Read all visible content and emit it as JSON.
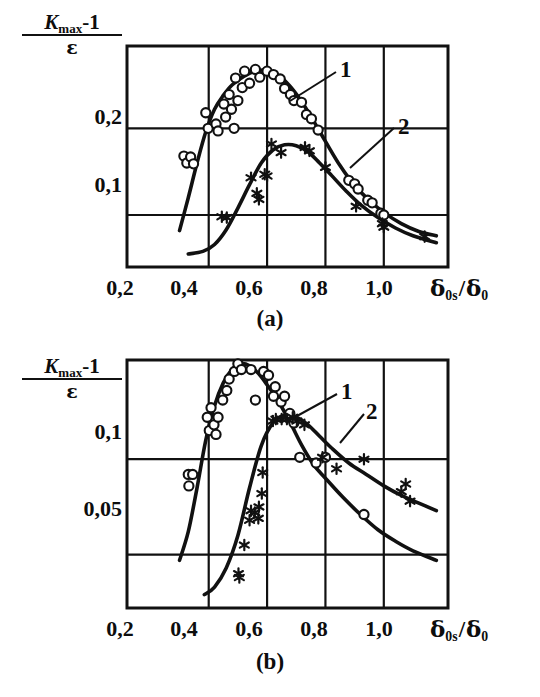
{
  "figure": {
    "background": "#ffffff",
    "ink": "#111111",
    "panels": [
      {
        "id": "a",
        "caption": "(a)",
        "y_axis": {
          "label_numerator_italic": "K",
          "label_numerator_sub": "max",
          "label_numerator_tail": "-1",
          "label_denominator": "ε",
          "ticks": [
            {
              "value": 0.2,
              "label": "0,2"
            },
            {
              "value": 0.1,
              "label": "0,1"
            }
          ]
        },
        "x_axis": {
          "title_symbol": "δ",
          "title_sub_1": "0s",
          "title_slash": "/",
          "title_symbol_2": "δ",
          "title_sub_2": "0",
          "ticks": [
            {
              "value": 0.2,
              "label": "0,2"
            },
            {
              "value": 0.4,
              "label": "0,4"
            },
            {
              "value": 0.6,
              "label": "0,6"
            },
            {
              "value": 0.8,
              "label": "0,8"
            },
            {
              "value": 1.0,
              "label": "1,0"
            }
          ]
        },
        "curve_tags": [
          {
            "text": "1"
          },
          {
            "text": "2"
          }
        ]
      },
      {
        "id": "b",
        "caption": "(b)",
        "y_axis": {
          "label_numerator_italic": "K",
          "label_numerator_sub": "max",
          "label_numerator_tail": "-1",
          "label_denominator": "ε",
          "ticks": [
            {
              "value": 0.1,
              "label": "0,1"
            },
            {
              "value": 0.05,
              "label": "0,05"
            }
          ]
        },
        "x_axis": {
          "title_symbol": "δ",
          "title_sub_1": "0s",
          "title_slash": "/",
          "title_symbol_2": "δ",
          "title_sub_2": "0",
          "ticks": [
            {
              "value": 0.2,
              "label": "0,2"
            },
            {
              "value": 0.4,
              "label": "0,4"
            },
            {
              "value": 0.6,
              "label": "0,6"
            },
            {
              "value": 0.8,
              "label": "0,8"
            },
            {
              "value": 1.0,
              "label": "1,0"
            }
          ]
        },
        "curve_tags": [
          {
            "text": "1"
          },
          {
            "text": "2"
          }
        ]
      }
    ]
  },
  "chart_data": [
    {
      "id": "a",
      "type": "scatter",
      "title": "(a)",
      "xlabel": "δ₀ₛ/δ₀",
      "ylabel": "(K_max − 1)/ε",
      "xlim": [
        0.12,
        1.22
      ],
      "ylim": [
        0.04,
        0.295
      ],
      "grid": true,
      "xticks": [
        0.2,
        0.4,
        0.6,
        0.8,
        1.0
      ],
      "yticks": [
        0.1,
        0.2
      ],
      "legend_position": "inside-annotations",
      "series": [
        {
          "name": "1",
          "marker": "open-circle",
          "points": [
            [
              0.315,
              0.168
            ],
            [
              0.325,
              0.16
            ],
            [
              0.338,
              0.167
            ],
            [
              0.348,
              0.159
            ],
            [
              0.39,
              0.218
            ],
            [
              0.398,
              0.2
            ],
            [
              0.425,
              0.205
            ],
            [
              0.432,
              0.197
            ],
            [
              0.452,
              0.228
            ],
            [
              0.458,
              0.213
            ],
            [
              0.47,
              0.239
            ],
            [
              0.478,
              0.222
            ],
            [
              0.487,
              0.2
            ],
            [
              0.492,
              0.258
            ],
            [
              0.5,
              0.232
            ],
            [
              0.515,
              0.247
            ],
            [
              0.523,
              0.266
            ],
            [
              0.54,
              0.252
            ],
            [
              0.56,
              0.268
            ],
            [
              0.575,
              0.259
            ],
            [
              0.6,
              0.266
            ],
            [
              0.622,
              0.262
            ],
            [
              0.645,
              0.257
            ],
            [
              0.66,
              0.246
            ],
            [
              0.68,
              0.239
            ],
            [
              0.692,
              0.232
            ],
            [
              0.718,
              0.23
            ],
            [
              0.735,
              0.216
            ],
            [
              0.752,
              0.211
            ],
            [
              0.775,
              0.198
            ],
            [
              0.88,
              0.14
            ],
            [
              0.9,
              0.136
            ],
            [
              0.912,
              0.13
            ],
            [
              0.945,
              0.117
            ],
            [
              0.96,
              0.114
            ],
            [
              0.99,
              0.102
            ],
            [
              1.0,
              0.1
            ]
          ],
          "curve": [
            [
              0.3,
              0.082
            ],
            [
              0.33,
              0.12
            ],
            [
              0.36,
              0.16
            ],
            [
              0.39,
              0.196
            ],
            [
              0.42,
              0.222
            ],
            [
              0.45,
              0.238
            ],
            [
              0.48,
              0.25
            ],
            [
              0.52,
              0.26
            ],
            [
              0.56,
              0.266
            ],
            [
              0.6,
              0.267
            ],
            [
              0.64,
              0.261
            ],
            [
              0.68,
              0.248
            ],
            [
              0.72,
              0.23
            ],
            [
              0.76,
              0.208
            ],
            [
              0.8,
              0.185
            ],
            [
              0.85,
              0.157
            ],
            [
              0.9,
              0.134
            ],
            [
              0.95,
              0.117
            ],
            [
              1.0,
              0.103
            ],
            [
              1.06,
              0.09
            ],
            [
              1.12,
              0.081
            ],
            [
              1.18,
              0.076
            ]
          ]
        },
        {
          "name": "2",
          "marker": "asterisk",
          "points": [
            [
              0.445,
              0.098
            ],
            [
              0.462,
              0.097
            ],
            [
              0.545,
              0.143
            ],
            [
              0.565,
              0.125
            ],
            [
              0.572,
              0.118
            ],
            [
              0.592,
              0.147
            ],
            [
              0.6,
              0.145
            ],
            [
              0.615,
              0.182
            ],
            [
              0.648,
              0.172
            ],
            [
              0.73,
              0.178
            ],
            [
              0.745,
              0.174
            ],
            [
              0.8,
              0.155
            ],
            [
              0.905,
              0.11
            ],
            [
              0.995,
              0.09
            ],
            [
              1.0,
              0.086
            ],
            [
              1.14,
              0.075
            ]
          ],
          "curve": [
            [
              0.33,
              0.055
            ],
            [
              0.38,
              0.058
            ],
            [
              0.42,
              0.066
            ],
            [
              0.46,
              0.083
            ],
            [
              0.5,
              0.108
            ],
            [
              0.54,
              0.135
            ],
            [
              0.58,
              0.16
            ],
            [
              0.62,
              0.175
            ],
            [
              0.66,
              0.181
            ],
            [
              0.7,
              0.18
            ],
            [
              0.74,
              0.173
            ],
            [
              0.78,
              0.16
            ],
            [
              0.82,
              0.146
            ],
            [
              0.87,
              0.128
            ],
            [
              0.92,
              0.112
            ],
            [
              0.98,
              0.097
            ],
            [
              1.04,
              0.085
            ],
            [
              1.1,
              0.076
            ],
            [
              1.18,
              0.068
            ]
          ]
        }
      ]
    },
    {
      "id": "b",
      "type": "scatter",
      "title": "(b)",
      "xlabel": "δ₀ₛ/δ₀",
      "ylabel": "(K_max − 1)/ε",
      "xlim": [
        0.12,
        1.22
      ],
      "ylim": [
        0.022,
        0.152
      ],
      "grid": true,
      "xticks": [
        0.2,
        0.4,
        0.6,
        0.8,
        1.0
      ],
      "yticks": [
        0.05,
        0.1
      ],
      "legend_position": "inside-annotations",
      "series": [
        {
          "name": "1",
          "marker": "open-circle",
          "points": [
            [
              0.33,
              0.092
            ],
            [
              0.345,
              0.092
            ],
            [
              0.332,
              0.086
            ],
            [
              0.395,
              0.122
            ],
            [
              0.402,
              0.115
            ],
            [
              0.408,
              0.127
            ],
            [
              0.418,
              0.118
            ],
            [
              0.425,
              0.113
            ],
            [
              0.432,
              0.122
            ],
            [
              0.448,
              0.131
            ],
            [
              0.462,
              0.136
            ],
            [
              0.47,
              0.142
            ],
            [
              0.488,
              0.146
            ],
            [
              0.5,
              0.15
            ],
            [
              0.512,
              0.147
            ],
            [
              0.545,
              0.147
            ],
            [
              0.56,
              0.131
            ],
            [
              0.588,
              0.146
            ],
            [
              0.605,
              0.144
            ],
            [
              0.622,
              0.133
            ],
            [
              0.628,
              0.138
            ],
            [
              0.648,
              0.13
            ],
            [
              0.66,
              0.133
            ],
            [
              0.678,
              0.124
            ],
            [
              0.692,
              0.119
            ],
            [
              0.712,
              0.101
            ],
            [
              0.768,
              0.098
            ],
            [
              0.8,
              0.101
            ],
            [
              0.932,
              0.071
            ]
          ],
          "curve": [
            [
              0.3,
              0.047
            ],
            [
              0.33,
              0.062
            ],
            [
              0.36,
              0.085
            ],
            [
              0.39,
              0.11
            ],
            [
              0.42,
              0.128
            ],
            [
              0.45,
              0.14
            ],
            [
              0.48,
              0.147
            ],
            [
              0.51,
              0.15
            ],
            [
              0.54,
              0.149
            ],
            [
              0.57,
              0.145
            ],
            [
              0.6,
              0.139
            ],
            [
              0.64,
              0.13
            ],
            [
              0.68,
              0.119
            ],
            [
              0.72,
              0.107
            ],
            [
              0.76,
              0.097
            ],
            [
              0.8,
              0.09
            ],
            [
              0.86,
              0.08
            ],
            [
              0.92,
              0.071
            ],
            [
              0.98,
              0.063
            ],
            [
              1.04,
              0.057
            ],
            [
              1.1,
              0.052
            ],
            [
              1.18,
              0.047
            ]
          ]
        },
        {
          "name": "2",
          "marker": "asterisk",
          "points": [
            [
              0.502,
              0.04
            ],
            [
              0.505,
              0.038
            ],
            [
              0.522,
              0.055
            ],
            [
              0.54,
              0.068
            ],
            [
              0.545,
              0.073
            ],
            [
              0.558,
              0.072
            ],
            [
              0.57,
              0.069
            ],
            [
              0.572,
              0.075
            ],
            [
              0.582,
              0.082
            ],
            [
              0.585,
              0.093
            ],
            [
              0.62,
              0.12
            ],
            [
              0.63,
              0.121
            ],
            [
              0.65,
              0.121
            ],
            [
              0.668,
              0.121
            ],
            [
              0.688,
              0.122
            ],
            [
              0.702,
              0.12
            ],
            [
              0.728,
              0.118
            ],
            [
              0.79,
              0.101
            ],
            [
              0.838,
              0.095
            ],
            [
              0.932,
              0.1
            ],
            [
              1.06,
              0.083
            ],
            [
              1.075,
              0.087
            ],
            [
              1.09,
              0.078
            ]
          ],
          "curve": [
            [
              0.385,
              0.029
            ],
            [
              0.42,
              0.033
            ],
            [
              0.46,
              0.043
            ],
            [
              0.5,
              0.06
            ],
            [
              0.54,
              0.085
            ],
            [
              0.58,
              0.107
            ],
            [
              0.62,
              0.119
            ],
            [
              0.66,
              0.123
            ],
            [
              0.7,
              0.122
            ],
            [
              0.74,
              0.118
            ],
            [
              0.78,
              0.112
            ],
            [
              0.82,
              0.106
            ],
            [
              0.88,
              0.098
            ],
            [
              0.94,
              0.092
            ],
            [
              1.0,
              0.086
            ],
            [
              1.06,
              0.081
            ],
            [
              1.12,
              0.077
            ],
            [
              1.18,
              0.073
            ]
          ]
        }
      ]
    }
  ]
}
